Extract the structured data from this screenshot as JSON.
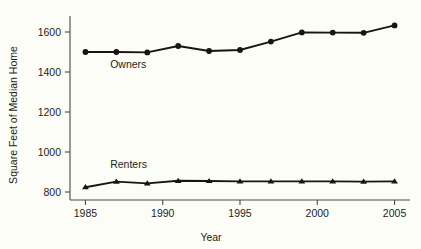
{
  "chart_data": {
    "type": "line",
    "title": "",
    "xlabel": "Year",
    "ylabel": "Square Feet of Median Home",
    "x": [
      1985,
      1987,
      1989,
      1991,
      1993,
      1995,
      1997,
      1999,
      2001,
      2003,
      2005
    ],
    "xlim": [
      1984,
      2006
    ],
    "ylim": [
      760,
      1680
    ],
    "xticks": [
      1985,
      1990,
      1995,
      2000,
      2005
    ],
    "xtick_labels": [
      "1985",
      "1990",
      "1995",
      "2000",
      "2005"
    ],
    "yticks": [
      800,
      1000,
      1200,
      1400,
      1600
    ],
    "ytick_labels": [
      "800",
      "1000",
      "1200",
      "1400",
      "1600"
    ],
    "grid": false,
    "legend_position": "inline-annotation",
    "series": [
      {
        "name": "Owners",
        "marker": "circle",
        "color": "#17150f",
        "label_x": 1986.6,
        "label_y": 1420,
        "values": [
          1500,
          1500,
          1498,
          1530,
          1505,
          1510,
          1552,
          1598,
          1597,
          1596,
          1633
        ]
      },
      {
        "name": "Renters",
        "marker": "triangle",
        "color": "#17150f",
        "label_x": 1986.6,
        "label_y": 920,
        "values": [
          824,
          852,
          843,
          856,
          855,
          853,
          853,
          853,
          853,
          852,
          853
        ]
      }
    ]
  },
  "axis": {
    "x_title": "Year",
    "y_title": "Square Feet of Median Home"
  },
  "colors": {
    "background": "#fdfdf7",
    "ink": "#17150f",
    "axis": "#4a4a44"
  }
}
